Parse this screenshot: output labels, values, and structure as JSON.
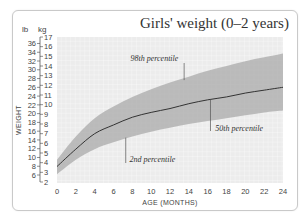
{
  "chart_data": {
    "type": "area",
    "title": "Girls' weight (0–2 years)",
    "xlabel": "AGE (MONTHS)",
    "ylabel": "WEIGHT",
    "y_units": [
      "lb",
      "kg"
    ],
    "x": [
      0,
      2,
      4,
      6,
      8,
      10,
      12,
      14,
      16,
      18,
      20,
      22,
      24
    ],
    "xlim": [
      0,
      24
    ],
    "ylim_kg": [
      2,
      17
    ],
    "ylim_lb": [
      6,
      36
    ],
    "x_ticks": [
      "0",
      "2",
      "4",
      "6",
      "8",
      "10",
      "12",
      "14",
      "16",
      "18",
      "20",
      "22",
      "24"
    ],
    "kg_ticks": [
      "2",
      "3",
      "4",
      "5",
      "6",
      "7",
      "8",
      "9",
      "10",
      "11",
      "12",
      "13",
      "14",
      "15",
      "16",
      "17"
    ],
    "lb_ticks": [
      "6",
      "8",
      "10",
      "12",
      "14",
      "16",
      "18",
      "20",
      "22",
      "24",
      "26",
      "28",
      "30",
      "32",
      "34",
      "36"
    ],
    "grid": true,
    "series": [
      {
        "name": "98th percentile",
        "values": [
          4.3,
          6.7,
          8.6,
          9.8,
          10.8,
          11.6,
          12.3,
          12.9,
          13.5,
          14.0,
          14.5,
          14.9,
          15.3
        ]
      },
      {
        "name": "50th percentile",
        "values": [
          3.6,
          5.4,
          7.0,
          7.9,
          8.7,
          9.2,
          9.6,
          10.1,
          10.5,
          10.8,
          11.2,
          11.5,
          11.8
        ]
      },
      {
        "name": "2nd percentile",
        "values": [
          2.8,
          4.3,
          5.4,
          6.1,
          6.7,
          7.2,
          7.6,
          8.0,
          8.3,
          8.6,
          8.9,
          9.2,
          9.4
        ]
      }
    ],
    "annotations": [
      "98th percentile",
      "50th percentile",
      "2nd percentile"
    ]
  }
}
